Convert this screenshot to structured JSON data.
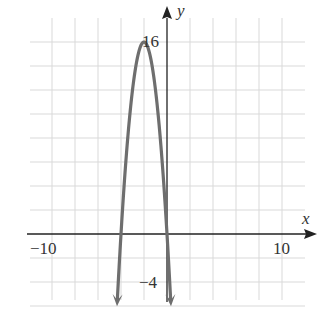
{
  "chart_data": {
    "type": "line",
    "title": "",
    "xlabel": "x",
    "ylabel": "y",
    "xlim": [
      -12,
      12
    ],
    "ylim": [
      -7,
      17
    ],
    "grid": true,
    "grid_step": {
      "x": 2,
      "y": 2
    },
    "tick_labels": {
      "x": [
        {
          "value": -10,
          "label": "−10"
        },
        {
          "value": 10,
          "label": "10"
        }
      ],
      "y": [
        {
          "value": 16,
          "label": "16"
        },
        {
          "value": -4,
          "label": "−4"
        }
      ]
    },
    "series": [
      {
        "name": "parabola",
        "equation": "y = -4(x+2)^2 + 16",
        "vertex": [
          -2,
          16
        ],
        "x_intercepts": [
          -4,
          0
        ],
        "y_intercept": 0,
        "color": "#6e6e6e",
        "arrows_at_ends": true,
        "x": [
          -4.3,
          -4,
          -3.5,
          -3,
          -2.5,
          -2,
          -1.5,
          -1,
          -0.5,
          0,
          0.3
        ],
        "y": [
          -5.16,
          0,
          7,
          12,
          15,
          16,
          15,
          12,
          7,
          0,
          -5.16
        ]
      }
    ]
  },
  "axes": {
    "x_label": "x",
    "y_label": "y",
    "tick_neg10": "−10",
    "tick_10": "10",
    "tick_16": "16",
    "tick_neg4": "−4"
  },
  "colors": {
    "grid": "#d9d9d9",
    "axis": "#222222",
    "curve": "#6e6e6e"
  }
}
